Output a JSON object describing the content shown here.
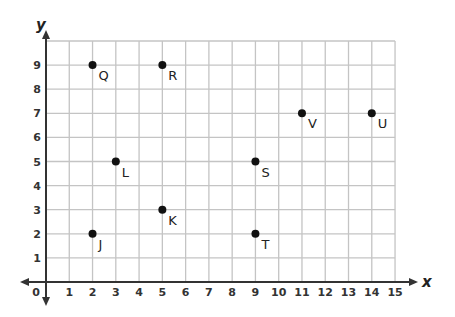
{
  "chart_data": {
    "type": "scatter",
    "title": "",
    "xlabel": "x",
    "ylabel": "y",
    "xlim": [
      0,
      15
    ],
    "ylim": [
      0,
      10
    ],
    "grid": true,
    "x_ticks": [
      0,
      1,
      2,
      3,
      4,
      5,
      6,
      7,
      8,
      9,
      10,
      11,
      12,
      13,
      14,
      15
    ],
    "y_ticks": [
      1,
      2,
      3,
      4,
      5,
      6,
      7,
      8,
      9
    ],
    "points": [
      {
        "label": "Q",
        "x": 2,
        "y": 9
      },
      {
        "label": "R",
        "x": 5,
        "y": 9
      },
      {
        "label": "V",
        "x": 11,
        "y": 7
      },
      {
        "label": "U",
        "x": 14,
        "y": 7
      },
      {
        "label": "L",
        "x": 3,
        "y": 5
      },
      {
        "label": "S",
        "x": 9,
        "y": 5
      },
      {
        "label": "K",
        "x": 5,
        "y": 3
      },
      {
        "label": "J",
        "x": 2,
        "y": 2
      },
      {
        "label": "T",
        "x": 9,
        "y": 2
      }
    ]
  },
  "colors": {
    "grid": "#c4c4c4",
    "axis": "#333333",
    "point": "#111111"
  }
}
